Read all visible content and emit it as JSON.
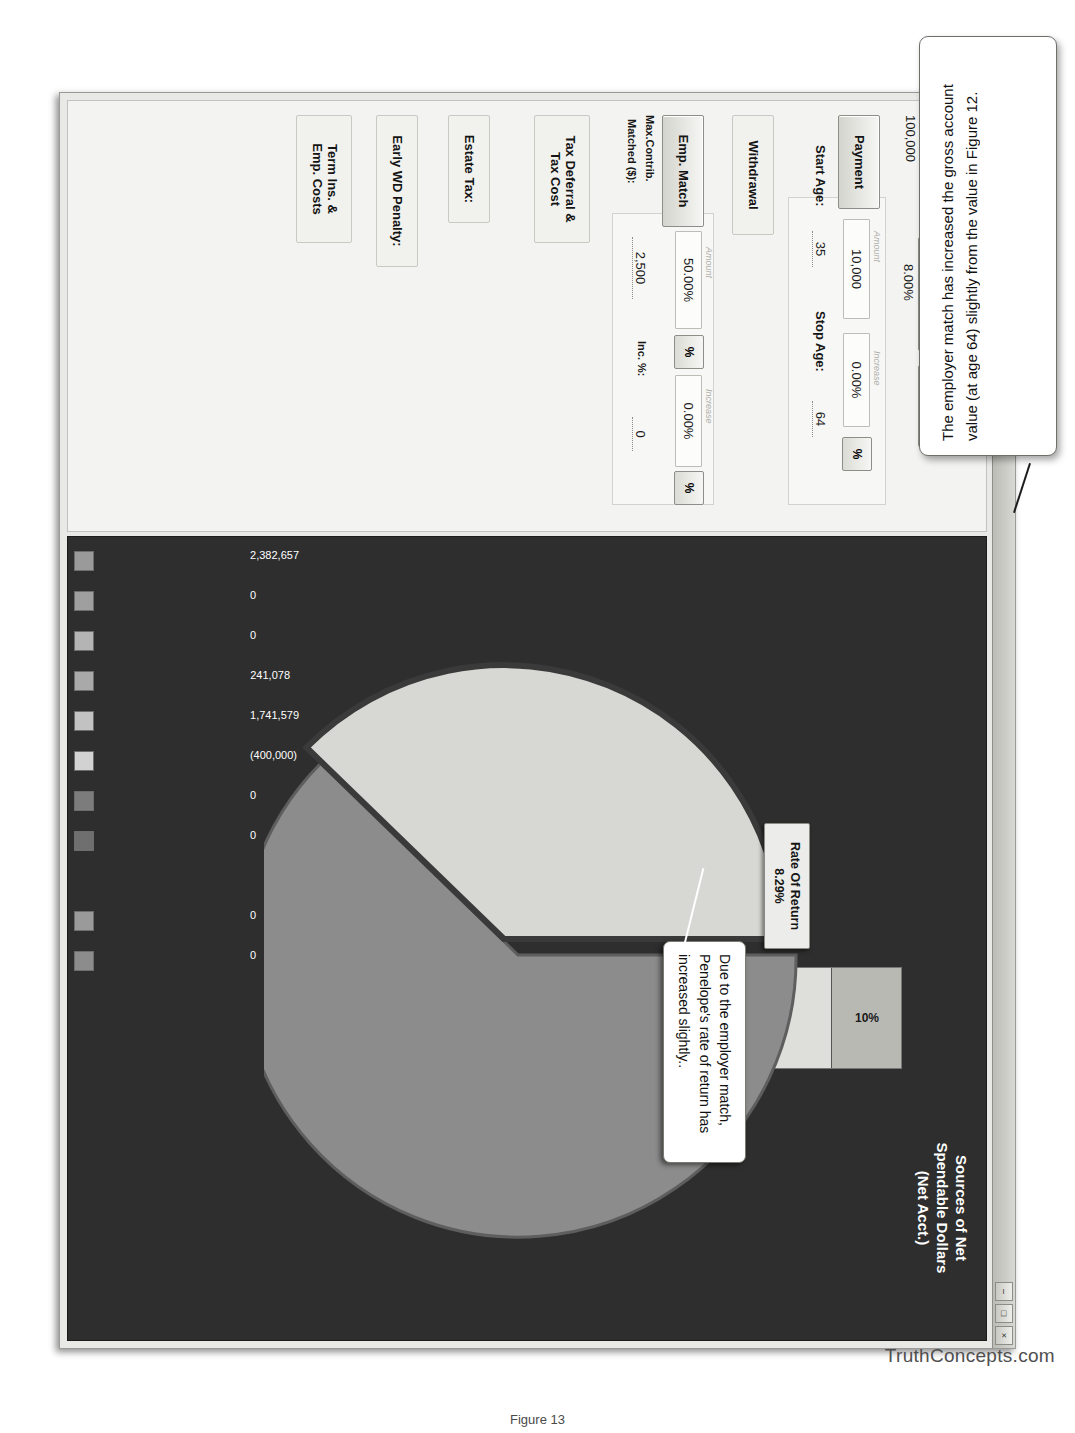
{
  "window": {
    "title": "Qualified Plan",
    "icon": "app-logo-icon",
    "buttons": {
      "minimize": "–",
      "maximize": "□",
      "close": "×"
    }
  },
  "toolbar": {
    "print_label": "print-icon",
    "copy_label": "copy-icon",
    "grid_label": "grid-icon",
    "new_label": "New",
    "title_label": "Title",
    "clear_label": "Clear"
  },
  "inputs": {
    "current_age_label": "Current Age:",
    "current_age_value": "35",
    "projected_age_label": "Projected Age:",
    "projected_age_value": "64",
    "present_value_label": "Present Value",
    "present_value_value": "100,000",
    "earnings_rate_label": "Earnings Rate",
    "earnings_rate_value": "8.00%",
    "mgt_fee_label": "Mgt.Fee",
    "payment_label": "Payment",
    "payment_amount_hint": "Amount",
    "payment_amount": "10,000",
    "payment_increase_hint": "Increase",
    "payment_increase": "0.00%",
    "payment_pct_button": "%",
    "start_age_label": "Start Age:",
    "start_age_value": "35",
    "stop_age_label": "Stop Age:",
    "stop_age_value": "64",
    "withdrawal_label": "Withdrawal",
    "emp_match_label": "Emp. Match",
    "emp_match_amount_hint": "Amount",
    "emp_match_amount": "50.00%",
    "emp_match_pct_button": "%",
    "emp_match_increase_hint": "Increase",
    "emp_match_increase": "0.00%",
    "emp_match_increase_pct_button": "%",
    "max_contrib_label": "Max.Contrib.\nMatched ($):",
    "max_contrib_label_line1": "Max.Contrib.",
    "max_contrib_label_line2": "Matched ($):",
    "max_contrib_value": "2,500",
    "inc_pct_label": "Inc. %:",
    "inc_pct_value": "0",
    "tax_deferral_label_line1": "Tax Deferral &",
    "tax_deferral_label_line2": "Tax Cost",
    "estate_tax_label": "Estate Tax:",
    "early_wd_label": "Early WD Penalty:",
    "term_ins_label_line1": "Term Ins. &",
    "term_ins_label_line2": "Emp. Costs"
  },
  "readouts": {
    "rate_of_return_label": "Rate Of Return",
    "rate_of_return_value": "8.29%",
    "gross_account_value": "Gross Account Value: 2,382,657"
  },
  "chart_data": {
    "type": "bar",
    "title": "Sources of Net\nSpendable Dollars\n(Net Acct.)",
    "title_line1": "Sources of Net",
    "title_line2": "Spendable Dollars",
    "title_line3": "(Net Acct.)",
    "orientation": "stacked-horizontal",
    "categories": [
      "Net Contributions",
      "Net Earnings",
      "Net Employer Match"
    ],
    "values": [
      10,
      73,
      17
    ],
    "labels": [
      "10%",
      "73%",
      "17%"
    ],
    "colors": [
      "#b9b9b4",
      "#dededa",
      "#e3e3df"
    ],
    "xlabel": "",
    "ylabel": "",
    "grid": false,
    "legend": "none"
  },
  "pie_chart": {
    "type": "pie",
    "title": "",
    "slices": [
      {
        "label": "Net Earnings",
        "value": 73,
        "color": "#8c8c8c"
      },
      {
        "label": "Net Employer Match / Contributions",
        "value": 17,
        "color": "#d7d7d3"
      }
    ]
  },
  "results": {
    "columns": [
      "Net Account Value",
      "Net Withdrawals",
      "Net Tax Deferral",
      "Net Employer Match",
      "Net Earnings",
      "Net Contributions",
      "Income Taxes",
      "Management Fees",
      "Early WD Penalty",
      "Estate Tax"
    ],
    "values": [
      "2,382,657",
      "0",
      "0",
      "241,078",
      "1,741,579",
      "(400,000)",
      "0",
      "0",
      "0",
      "0"
    ],
    "swatches": [
      "#9a9a9a",
      "#9f9f9f",
      "#b4b4b4",
      "#a9a9a9",
      "#c2c2c2",
      "#d2d2d2",
      "#7c7c7c",
      "#6f6f6f",
      "#9a9a9a",
      "#8c8c8c"
    ]
  },
  "annotations": {
    "pie_note": "Due to the employer match, Penelope's rate of return has increased slightly..",
    "inputs_note": "Inputs for employer match information.",
    "figure_note": "The employer match has increased the gross account value (at age 64) slightly from the value in Figure 12."
  },
  "branding": {
    "watermark": "TruthConcepts.com",
    "figure_caption": "Figure 13"
  }
}
